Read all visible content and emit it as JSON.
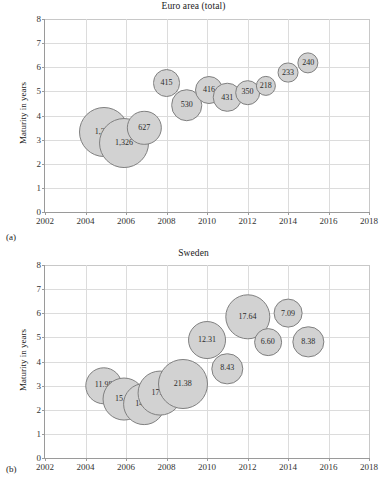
{
  "figure": {
    "panels": [
      {
        "key": "euro",
        "label": "(a)",
        "title": "Euro area (total)",
        "ylabel": "Maturity in years"
      },
      {
        "key": "sweden",
        "label": "(b)",
        "title": "Sweden",
        "ylabel": "Maturity in years"
      }
    ]
  },
  "axis": {
    "yticks": [
      "0",
      "1",
      "2",
      "3",
      "4",
      "5",
      "6",
      "7",
      "8"
    ],
    "xticks": [
      "2002",
      "2004",
      "2006",
      "2008",
      "2010",
      "2012",
      "2014",
      "2016",
      "2018"
    ]
  },
  "colors": {
    "bubble_fill": "#d2d2d2",
    "bubble_stroke": "#808080",
    "grid": "#dcdcdc",
    "axis": "#9a9a9a",
    "text": "#1a1a1a"
  },
  "chart_data": [
    {
      "type": "scatter",
      "subtype": "bubble",
      "panel": "(a)",
      "title": "Euro area (total)",
      "xlabel": "",
      "ylabel": "Maturity in years",
      "xlim": [
        2002,
        2018
      ],
      "ylim": [
        0,
        8
      ],
      "xticks": [
        2002,
        2004,
        2006,
        2008,
        2010,
        2012,
        2014,
        2016,
        2018
      ],
      "yticks": [
        0,
        1,
        2,
        3,
        4,
        5,
        6,
        7,
        8
      ],
      "grid": true,
      "legend": "none",
      "size_label_note": "Bubble area scales with the labelled value (issuance volume)",
      "points": [
        {
          "x": 2004.9,
          "y": 3.3,
          "size": 1330,
          "label": "1,330"
        },
        {
          "x": 2005.9,
          "y": 2.85,
          "size": 1326,
          "label": "1,326"
        },
        {
          "x": 2006.9,
          "y": 3.5,
          "size": 627,
          "label": "627"
        },
        {
          "x": 2008.0,
          "y": 5.35,
          "size": 415,
          "label": "415"
        },
        {
          "x": 2009.0,
          "y": 4.42,
          "size": 530,
          "label": "530"
        },
        {
          "x": 2010.1,
          "y": 5.07,
          "size": 416,
          "label": "416"
        },
        {
          "x": 2011.0,
          "y": 4.75,
          "size": 431,
          "label": "431"
        },
        {
          "x": 2012.0,
          "y": 4.95,
          "size": 350,
          "label": "350"
        },
        {
          "x": 2012.9,
          "y": 5.22,
          "size": 218,
          "label": "218"
        },
        {
          "x": 2014.0,
          "y": 5.78,
          "size": 233,
          "label": "233"
        },
        {
          "x": 2015.0,
          "y": 6.18,
          "size": 240,
          "label": "240"
        }
      ]
    },
    {
      "type": "scatter",
      "subtype": "bubble",
      "panel": "(b)",
      "title": "Sweden",
      "xlabel": "",
      "ylabel": "Maturity in years",
      "xlim": [
        2002,
        2018
      ],
      "ylim": [
        0,
        8
      ],
      "xticks": [
        2002,
        2004,
        2006,
        2008,
        2010,
        2012,
        2014,
        2016,
        2018
      ],
      "yticks": [
        0,
        1,
        2,
        3,
        4,
        5,
        6,
        7,
        8
      ],
      "grid": true,
      "legend": "none",
      "size_label_note": "Bubble area scales with the labelled value (issuance volume)",
      "points": [
        {
          "x": 2004.9,
          "y": 3.0,
          "size": 11.98,
          "label": "11.98"
        },
        {
          "x": 2005.9,
          "y": 2.45,
          "size": 15.76,
          "label": "15.76"
        },
        {
          "x": 2006.9,
          "y": 2.25,
          "size": 14.95,
          "label": "14.95"
        },
        {
          "x": 2007.7,
          "y": 2.7,
          "size": 17.2,
          "label": "17.20"
        },
        {
          "x": 2008.8,
          "y": 3.05,
          "size": 21.38,
          "label": "21.38"
        },
        {
          "x": 2010.0,
          "y": 4.9,
          "size": 12.31,
          "label": "12.31"
        },
        {
          "x": 2011.0,
          "y": 3.7,
          "size": 8.43,
          "label": "8.43"
        },
        {
          "x": 2012.0,
          "y": 5.85,
          "size": 17.64,
          "label": "17.64"
        },
        {
          "x": 2013.0,
          "y": 4.8,
          "size": 6.6,
          "label": "6.60"
        },
        {
          "x": 2014.0,
          "y": 6.0,
          "size": 7.09,
          "label": "7.09"
        },
        {
          "x": 2015.0,
          "y": 4.8,
          "size": 8.38,
          "label": "8.38"
        }
      ]
    }
  ]
}
